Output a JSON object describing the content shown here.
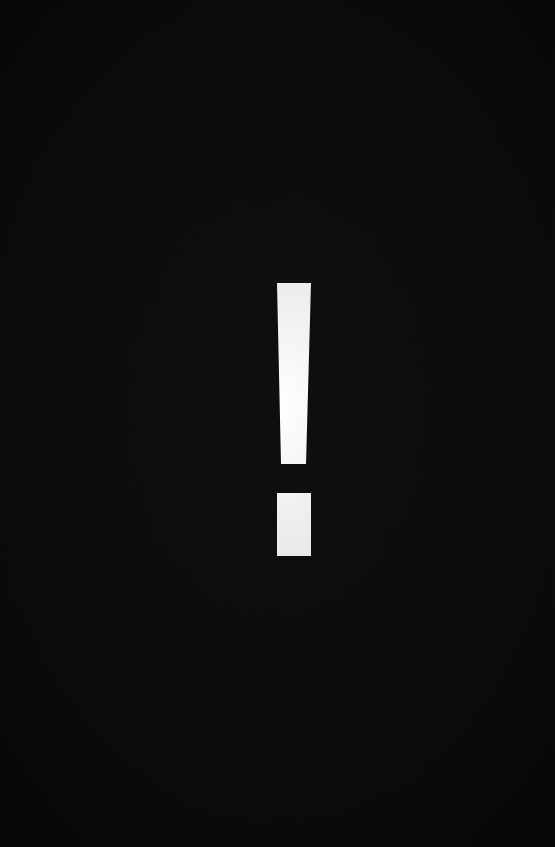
{
  "canvas": {
    "width": 555,
    "height": 847,
    "background_color": "#0d0d0d",
    "description": "Solid near-black field with faint grain and corner vignette"
  },
  "symbol": {
    "name": "exclamation-mark",
    "character": "!",
    "meaning": "warning",
    "fill_color": "#ffffff",
    "center_x": 294,
    "stem": {
      "top_y": 283,
      "bottom_y": 464,
      "top_left_x": 277,
      "top_right_x": 311,
      "bottom_left_x": 281,
      "bottom_right_x": 306,
      "top_width": 34,
      "bottom_width": 25,
      "height": 181
    },
    "dot": {
      "left_x": 277,
      "top_y": 493,
      "width": 34,
      "height": 63,
      "right_x": 311,
      "bottom_y": 556
    },
    "gap_between_stem_and_dot": 29
  }
}
